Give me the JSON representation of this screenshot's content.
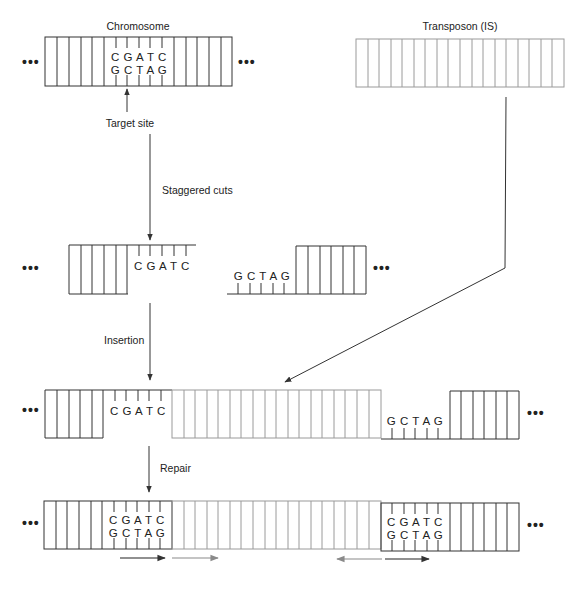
{
  "labels": {
    "chromosome": "Chromosome",
    "transposon": "Transposon (IS)",
    "target_site": "Target site",
    "staggered_cuts": "Staggered cuts",
    "insertion": "Insertion",
    "repair": "Repair"
  },
  "sequences": {
    "top_strand": "C G A T C",
    "bottom_strand": "G C T A G"
  },
  "ellipsis": "•••",
  "colors": {
    "chromosome_dna": "#333333",
    "transposon_dna": "#9a9a9a",
    "arrow": "#333333",
    "repeat_arrow_host": "#222222",
    "repeat_arrow_transposon": "#8a8a8a"
  },
  "steps": [
    "Target site",
    "Staggered cuts",
    "Insertion",
    "Repair"
  ]
}
